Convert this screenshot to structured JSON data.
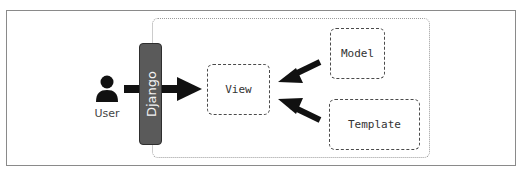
{
  "diagram": {
    "nodes": {
      "user": {
        "label": "User",
        "icon": "user-icon"
      },
      "django": {
        "label": "Django"
      },
      "view": {
        "label": "View"
      },
      "model": {
        "label": "Model"
      },
      "template": {
        "label": "Template"
      }
    },
    "edges": [
      {
        "from": "User",
        "to": "View",
        "via": "Django"
      },
      {
        "from": "Model",
        "to": "View"
      },
      {
        "from": "Template",
        "to": "View"
      }
    ],
    "colors": {
      "django_bar": "#5a5a5a",
      "arrow": "#111111",
      "box_border": "#4a4a4a"
    }
  }
}
